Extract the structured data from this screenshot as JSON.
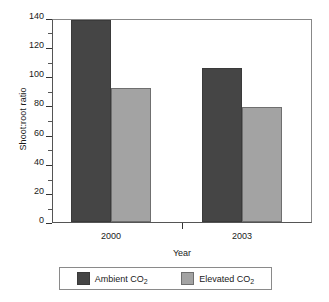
{
  "chart_data": {
    "type": "bar",
    "title": "",
    "xlabel": "Year",
    "ylabel": "Shoot:root ratio",
    "categories": [
      "2000",
      "2003"
    ],
    "series": [
      {
        "name": "Ambient CO2",
        "label": "Ambient CO",
        "sub": "2",
        "color": "#454545",
        "values": [
          140,
          107
        ]
      },
      {
        "name": "Elevated CO2",
        "label": "Elevated CO",
        "sub": "2",
        "color": "#a3a3a3",
        "values": [
          93,
          80
        ]
      }
    ],
    "ylim": [
      0,
      140
    ],
    "ytick_major": [
      "0",
      "20",
      "40",
      "60",
      "80",
      "100",
      "120",
      "140"
    ],
    "ytick_major_values": [
      0,
      20,
      40,
      60,
      80,
      100,
      120,
      140
    ],
    "ytick_minor_values": [
      10,
      30,
      50,
      70,
      90,
      110,
      130
    ],
    "grid": false,
    "legend_position": "bottom"
  },
  "axis": {
    "y_label": "Shoot:root ratio",
    "x_label": "Year",
    "y_0": "0",
    "y_20": "20",
    "y_40": "40",
    "y_60": "60",
    "y_80": "80",
    "y_100": "100",
    "y_120": "120",
    "y_140": "140",
    "x_cat_0": "2000",
    "x_cat_1": "2003"
  },
  "legend": {
    "items": [
      {
        "label": "Ambient CO",
        "sub": "2"
      },
      {
        "label": "Elevated CO",
        "sub": "2"
      }
    ]
  }
}
